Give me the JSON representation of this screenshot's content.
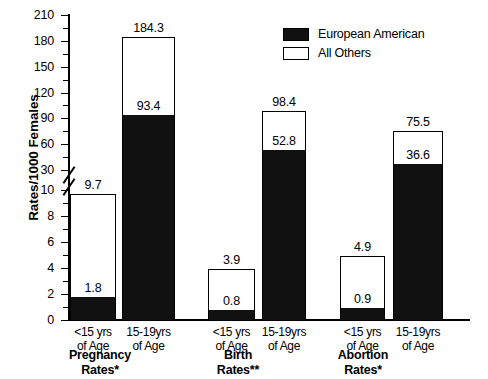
{
  "chart_data": {
    "type": "bar",
    "title": "",
    "xlabel": "",
    "ylabel": "Rates/1000 Females",
    "stacked": true,
    "grid": false,
    "legend_position": "top-right",
    "axis_break": {
      "lower_range": [
        0,
        10
      ],
      "upper_range": [
        30,
        210
      ]
    },
    "yticks_lower": [
      "0",
      "2",
      "4",
      "6",
      "8",
      "10"
    ],
    "yticks_upper": [
      "30",
      "60",
      "90",
      "120",
      "150",
      "180",
      "210"
    ],
    "ylim": [
      0,
      210
    ],
    "groups": [
      {
        "label_line1": "Pregnancy",
        "label_line2": "Rates*",
        "bars": [
          {
            "category_line1": "<15 yrs",
            "category_line2": "of Age",
            "total": 9.7,
            "european_american": 1.8,
            "total_label": "9.7",
            "ea_label": "1.8"
          },
          {
            "category_line1": "15-19yrs",
            "category_line2": "of Age",
            "total": 184.3,
            "european_american": 93.4,
            "total_label": "184.3",
            "ea_label": "93.4"
          }
        ]
      },
      {
        "label_line1": "Birth",
        "label_line2": "Rates**",
        "bars": [
          {
            "category_line1": "<15 yrs",
            "category_line2": "of Age",
            "total": 3.9,
            "european_american": 0.8,
            "total_label": "3.9",
            "ea_label": "0.8"
          },
          {
            "category_line1": "15-19yrs",
            "category_line2": "of Age",
            "total": 98.4,
            "european_american": 52.8,
            "total_label": "98.4",
            "ea_label": "52.8"
          }
        ]
      },
      {
        "label_line1": "Abortion",
        "label_line2": "Rates*",
        "bars": [
          {
            "category_line1": "<15 yrs",
            "category_line2": "of Age",
            "total": 4.9,
            "european_american": 0.9,
            "total_label": "4.9",
            "ea_label": "0.9"
          },
          {
            "category_line1": "15-19yrs",
            "category_line2": "of Age",
            "total": 75.5,
            "european_american": 36.6,
            "total_label": "75.5",
            "ea_label": "36.6"
          }
        ]
      }
    ],
    "series": [
      {
        "name": "European American",
        "color": "#111111",
        "values": [
          1.8,
          93.4,
          0.8,
          52.8,
          0.9,
          36.6
        ]
      },
      {
        "name": "All Others",
        "color": "#ffffff",
        "values": [
          9.7,
          184.3,
          3.9,
          98.4,
          4.9,
          75.5
        ]
      }
    ],
    "categories": [
      "Pregnancy Rates* <15 yrs of Age",
      "Pregnancy Rates* 15-19yrs of Age",
      "Birth Rates** <15 yrs of Age",
      "Birth Rates** 15-19yrs of Age",
      "Abortion Rates* <15 yrs of Age",
      "Abortion Rates* 15-19yrs of Age"
    ]
  },
  "legend": {
    "items": [
      {
        "label": "European American",
        "swatch": "black"
      },
      {
        "label": "All Others",
        "swatch": "white"
      }
    ]
  },
  "axis": {
    "ylabel": "Rates/1000 Females"
  }
}
